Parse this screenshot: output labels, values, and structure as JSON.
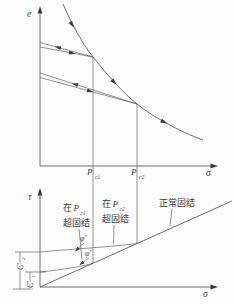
{
  "figure": {
    "top_plot": {
      "y_axis_label": "e",
      "x_axis_label": "σ",
      "pc1": {
        "base": "P",
        "sub": "c1"
      },
      "pc2": {
        "base": "P",
        "sub": "c2"
      }
    },
    "bottom_plot": {
      "y_axis_label": "τ",
      "x_axis_label": "σ",
      "oc1_label": {
        "prefix": "在",
        "base": "P",
        "sub": "c1",
        "line2": "超固结"
      },
      "oc2_label": {
        "prefix": "在",
        "base": "P",
        "sub": "c2",
        "line2": "超固结"
      },
      "nc_label": "正常固结",
      "phi1": "φ′",
      "phi2": "φ′",
      "c2": {
        "base": "C′",
        "sub": "2"
      },
      "c1": {
        "base": "C′",
        "sub": "1"
      }
    }
  }
}
